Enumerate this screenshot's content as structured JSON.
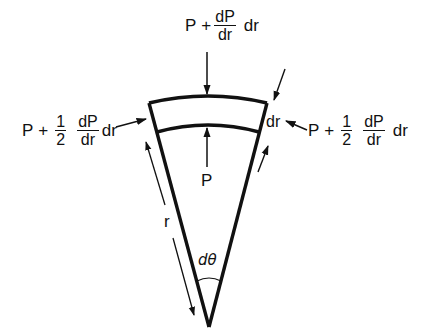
{
  "figure": {
    "stroke_color": "#111111",
    "background": "#ffffff"
  },
  "labels": {
    "top_force": {
      "base": "P",
      "plus": "+",
      "frac_num": "dP",
      "frac_den": "dr",
      "suffix": "dr"
    },
    "left_force": {
      "base": "P",
      "plus": "+",
      "coef_num": "1",
      "coef_den": "2",
      "frac_num": "dP",
      "frac_den": "dr",
      "suffix": "dr"
    },
    "right_force": {
      "base": "P",
      "plus": "+",
      "coef_num": "1",
      "coef_den": "2",
      "frac_num": "dP",
      "frac_den": "dr",
      "suffix": "dr"
    },
    "bottom_force": "P",
    "thickness": "dr",
    "radius": "r",
    "angle": "dθ"
  }
}
